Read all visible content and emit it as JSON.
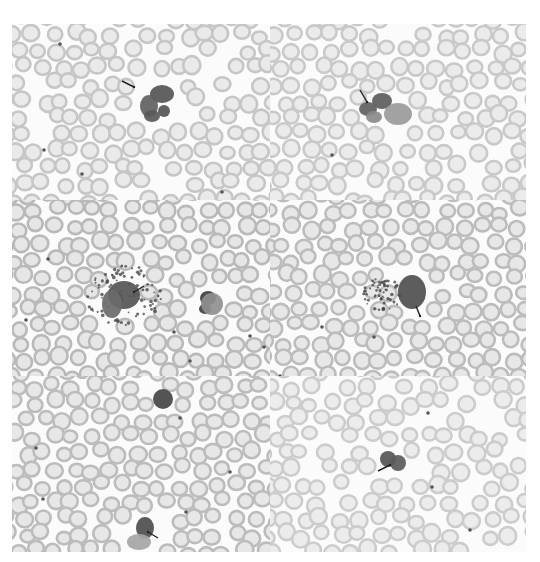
{
  "figure": {
    "background": "#ffffff",
    "rbc_ring_color": "#b9b9b9",
    "rbc_center_color": "#e6e6e6",
    "cell_dark": "#4a4a4a",
    "cell_mid": "#6f6f6f",
    "granule_color": "#3c3c3c",
    "arrow_color": "#222222"
  },
  "panels": [
    {
      "id": "top-left",
      "x": 0,
      "y": 0,
      "w": 258,
      "h": 176,
      "seed": 11,
      "density": 0.9,
      "tone": 0.8,
      "cells": [
        {
          "cx": 150,
          "cy": 70,
          "rx": 12,
          "ry": 9,
          "shade": "#555555"
        },
        {
          "cx": 137,
          "cy": 82,
          "rx": 9,
          "ry": 11,
          "shade": "#616161"
        },
        {
          "cx": 140,
          "cy": 92,
          "rx": 8,
          "ry": 6,
          "shade": "#5a5a5a"
        },
        {
          "cx": 152,
          "cy": 87,
          "rx": 6,
          "ry": 6,
          "shade": "#555555"
        }
      ],
      "dots": [
        [
          32,
          126
        ],
        [
          70,
          150
        ],
        [
          210,
          168
        ],
        [
          48,
          20
        ]
      ],
      "granules": [],
      "arrows": [
        {
          "x1": 110,
          "y1": 57,
          "x2": 122,
          "y2": 63
        }
      ]
    },
    {
      "id": "top-right",
      "x": 258,
      "y": 0,
      "w": 256,
      "h": 176,
      "seed": 23,
      "density": 0.9,
      "tone": 0.75,
      "cells": [
        {
          "cx": 112,
          "cy": 77,
          "rx": 10,
          "ry": 8,
          "shade": "#5c5c5c"
        },
        {
          "cx": 98,
          "cy": 85,
          "rx": 9,
          "ry": 7,
          "shade": "#606060"
        },
        {
          "cx": 128,
          "cy": 90,
          "rx": 14,
          "ry": 11,
          "shade": "#9a9a9a"
        },
        {
          "cx": 104,
          "cy": 93,
          "rx": 8,
          "ry": 6,
          "shade": "#8a8a8a"
        }
      ],
      "dots": [
        [
          62,
          131
        ]
      ],
      "granules": [],
      "arrows": [
        {
          "x1": 90,
          "y1": 66,
          "x2": 97,
          "y2": 78
        }
      ]
    },
    {
      "id": "middle-left",
      "x": 0,
      "y": 176,
      "w": 258,
      "h": 176,
      "seed": 37,
      "density": 1.0,
      "tone": 1.0,
      "cells": [
        {
          "cx": 112,
          "cy": 95,
          "rx": 16,
          "ry": 14,
          "shade": "#555555"
        },
        {
          "cx": 100,
          "cy": 104,
          "rx": 10,
          "ry": 14,
          "shade": "#6a6a6a"
        },
        {
          "cx": 196,
          "cy": 98,
          "rx": 8,
          "ry": 7,
          "shade": "#3d3d3d"
        },
        {
          "cx": 193,
          "cy": 109,
          "rx": 6,
          "ry": 5,
          "shade": "#3f3f3f"
        },
        {
          "cx": 200,
          "cy": 104,
          "rx": 11,
          "ry": 11,
          "shade": "#8f8f8f"
        }
      ],
      "dots": [
        [
          162,
          132
        ],
        [
          36,
          59
        ],
        [
          14,
          120
        ],
        [
          252,
          147
        ],
        [
          178,
          161
        ],
        [
          238,
          136
        ]
      ],
      "granules": [
        {
          "cx": 112,
          "cy": 95,
          "r": 38,
          "n": 90
        }
      ],
      "arrows": [
        {
          "x1": 132,
          "y1": 86,
          "x2": 122,
          "y2": 92
        }
      ]
    },
    {
      "id": "middle-right",
      "x": 258,
      "y": 176,
      "w": 256,
      "h": 176,
      "seed": 53,
      "density": 1.0,
      "tone": 0.95,
      "cells": [
        {
          "cx": 142,
          "cy": 92,
          "rx": 14,
          "ry": 17,
          "shade": "#4f4f4f"
        }
      ],
      "dots": [
        [
          52,
          127
        ],
        [
          104,
          137
        ],
        [
          10,
          176
        ]
      ],
      "granules": [
        {
          "cx": 112,
          "cy": 94,
          "r": 20,
          "n": 55
        }
      ],
      "arrows": [
        {
          "x1": 146,
          "y1": 106,
          "x2": 150,
          "y2": 116
        }
      ]
    },
    {
      "id": "bottom-left",
      "x": 0,
      "y": 352,
      "w": 258,
      "h": 176,
      "seed": 71,
      "density": 1.0,
      "tone": 0.95,
      "cells": [
        {
          "cx": 151,
          "cy": 23,
          "rx": 10,
          "ry": 10,
          "shade": "#454545"
        },
        {
          "cx": 133,
          "cy": 152,
          "rx": 9,
          "ry": 11,
          "shade": "#4e4e4e"
        },
        {
          "cx": 127,
          "cy": 166,
          "rx": 12,
          "ry": 8,
          "shade": "#a5a5a5"
        }
      ],
      "dots": [
        [
          31,
          123
        ],
        [
          168,
          42
        ],
        [
          24,
          72
        ],
        [
          174,
          136
        ],
        [
          218,
          96
        ]
      ],
      "granules": [],
      "arrows": [
        {
          "x1": 146,
          "y1": 162,
          "x2": 136,
          "y2": 156
        }
      ]
    },
    {
      "id": "bottom-right",
      "x": 258,
      "y": 352,
      "w": 256,
      "h": 176,
      "seed": 89,
      "density": 0.85,
      "tone": 0.7,
      "cells": [
        {
          "cx": 118,
          "cy": 83,
          "rx": 8,
          "ry": 8,
          "shade": "#555555"
        },
        {
          "cx": 128,
          "cy": 87,
          "rx": 8,
          "ry": 8,
          "shade": "#5a5a5a"
        }
      ],
      "dots": [
        [
          162,
          111
        ],
        [
          200,
          154
        ],
        [
          158,
          37
        ]
      ],
      "granules": [],
      "arrows": [
        {
          "x1": 108,
          "y1": 95,
          "x2": 120,
          "y2": 89
        }
      ]
    }
  ]
}
